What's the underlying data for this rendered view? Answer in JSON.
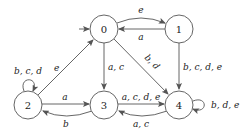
{
  "diagram": {
    "type": "finite-automaton",
    "start_state": "0",
    "nodes": [
      {
        "id": "0",
        "label": "0",
        "x": 104,
        "y": 29
      },
      {
        "id": "1",
        "label": "1",
        "x": 179,
        "y": 29
      },
      {
        "id": "2",
        "label": "2",
        "x": 28,
        "y": 105
      },
      {
        "id": "3",
        "label": "3",
        "x": 104,
        "y": 105
      },
      {
        "id": "4",
        "label": "4",
        "x": 179,
        "y": 105
      }
    ],
    "edges": [
      {
        "from": "0",
        "to": "1",
        "label": "e"
      },
      {
        "from": "1",
        "to": "0",
        "label": "a"
      },
      {
        "from": "0",
        "to": "3",
        "label": "a, c"
      },
      {
        "from": "0",
        "to": "4",
        "label": "b, d"
      },
      {
        "from": "1",
        "to": "4",
        "label": "b, c, d, e"
      },
      {
        "from": "2",
        "to": "0",
        "label": "e"
      },
      {
        "from": "2",
        "to": "2",
        "label": "b, c, d"
      },
      {
        "from": "2",
        "to": "3",
        "label": "a"
      },
      {
        "from": "3",
        "to": "2",
        "label": "b"
      },
      {
        "from": "3",
        "to": "4",
        "label": "a, c, d, e"
      },
      {
        "from": "4",
        "to": "3",
        "label": "a, c"
      },
      {
        "from": "4",
        "to": "4",
        "label": "b, d, e"
      }
    ]
  }
}
